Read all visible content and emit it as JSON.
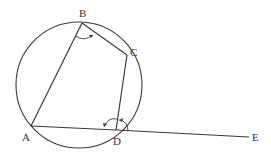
{
  "diagram": {
    "type": "cyclic-quadrilateral",
    "colors": {
      "stroke": "#3a3a3a",
      "label": "#333333",
      "background": "#ffffff"
    },
    "circle": {
      "cx": 79,
      "cy": 85,
      "r": 63
    },
    "points": {
      "A": {
        "label": "A",
        "x": 31,
        "y": 126,
        "lx": 22,
        "ly": 141
      },
      "B": {
        "label": "B",
        "x": 82,
        "y": 23,
        "lx": 79,
        "ly": 17
      },
      "C": {
        "label": "C",
        "x": 127,
        "y": 55,
        "lx": 130,
        "ly": 56
      },
      "D": {
        "label": "D",
        "x": 116,
        "y": 130,
        "lx": 113,
        "ly": 145
      },
      "E": {
        "label": "E",
        "x": 249,
        "y": 137,
        "lx": 252,
        "ly": 141
      }
    },
    "segments": [
      "AB",
      "BC",
      "CD",
      "AD",
      "DE"
    ],
    "angle_marks": [
      {
        "name": "angle-ABC",
        "at": "B"
      },
      {
        "name": "angle-ADC",
        "at": "D"
      },
      {
        "name": "angle-CDE",
        "at": "D"
      }
    ]
  }
}
